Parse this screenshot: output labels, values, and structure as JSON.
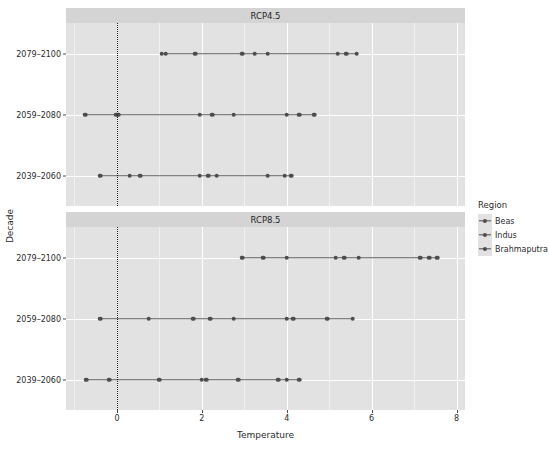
{
  "chart_data": {
    "type": "scatter",
    "title": "",
    "xlabel": "Temperature",
    "ylabel": "Decade",
    "xlim": [
      -1.2,
      8.2
    ],
    "xticks": [
      0,
      2,
      4,
      6,
      8
    ],
    "xticklabels": [
      "0",
      "2",
      "4",
      "6",
      "8"
    ],
    "grid": true,
    "legend_position": "right",
    "legend_title": "Region",
    "reference_line": {
      "x": 0,
      "style": "dotted",
      "color": "#1a1a1a"
    },
    "categories": [
      "2039-2060",
      "2059-2080",
      "2079-2100"
    ],
    "facets": [
      {
        "label": "RCP4.5",
        "rows": [
          {
            "decade": "2079-2100",
            "series": [
              {
                "name": "Beas",
                "values": [
                  1.05,
                  1.15,
                  1.85
                ]
              },
              {
                "name": "Indus",
                "values": [
                  2.95,
                  3.25,
                  3.55
                ]
              },
              {
                "name": "Brahmaputra",
                "values": [
                  5.2,
                  5.4,
                  5.65
                ]
              }
            ]
          },
          {
            "decade": "2059-2080",
            "series": [
              {
                "name": "Beas",
                "values": [
                  -0.75,
                  -0.02,
                  0.03
                ]
              },
              {
                "name": "Indus",
                "values": [
                  1.95,
                  2.25,
                  2.75
                ]
              },
              {
                "name": "Brahmaputra",
                "values": [
                  4.0,
                  4.3,
                  4.65
                ]
              }
            ]
          },
          {
            "decade": "2039-2060",
            "series": [
              {
                "name": "Beas",
                "values": [
                  -0.4,
                  0.3,
                  0.55
                ]
              },
              {
                "name": "Indus",
                "values": [
                  1.95,
                  2.15,
                  2.35
                ]
              },
              {
                "name": "Brahmaputra",
                "values": [
                  3.55,
                  3.95,
                  4.1
                ]
              }
            ]
          }
        ]
      },
      {
        "label": "RCP8.5",
        "rows": [
          {
            "decade": "2079-2100",
            "series": [
              {
                "name": "Beas",
                "values": [
                  2.95,
                  3.45,
                  4.0
                ]
              },
              {
                "name": "Indus",
                "values": [
                  5.15,
                  5.35,
                  5.7
                ]
              },
              {
                "name": "Brahmaputra",
                "values": [
                  7.15,
                  7.35,
                  7.55
                ]
              }
            ]
          },
          {
            "decade": "2059-2080",
            "series": [
              {
                "name": "Beas",
                "values": [
                  -0.4,
                  0.75,
                  1.8
                ]
              },
              {
                "name": "Indus",
                "values": [
                  2.2,
                  2.75,
                  4.0
                ]
              },
              {
                "name": "Brahmaputra",
                "values": [
                  4.15,
                  4.95,
                  5.55
                ]
              }
            ]
          },
          {
            "decade": "2039-2060",
            "series": [
              {
                "name": "Beas",
                "values": [
                  -0.73,
                  -0.18,
                  1.0
                ]
              },
              {
                "name": "Indus",
                "values": [
                  2.0,
                  2.1,
                  2.85
                ]
              },
              {
                "name": "Brahmaputra",
                "values": [
                  3.8,
                  4.0,
                  4.3
                ]
              }
            ]
          }
        ]
      }
    ],
    "series_colors": {
      "Beas": "#4d4d4d",
      "Indus": "#4d4d4d",
      "Brahmaputra": "#4d4d4d"
    }
  },
  "legend": {
    "title": "Region",
    "items": [
      {
        "label": "Beas",
        "color": "#4d4d4d"
      },
      {
        "label": "Indus",
        "color": "#4d4d4d"
      },
      {
        "label": "Brahmaputra",
        "color": "#4d4d4d"
      }
    ]
  },
  "axes": {
    "x_title": "Temperature",
    "y_title": "Decade",
    "x_tick_labels": [
      "0",
      "2",
      "4",
      "6",
      "8"
    ],
    "y_tick_labels": [
      "2079-2100",
      "2059-2080",
      "2039-2060"
    ]
  },
  "theme": {
    "panel_bg": "#e2e2e2",
    "strip_bg": "#d4d4d4",
    "grid_color": "#ffffff",
    "text_color": "#2b2b2b"
  }
}
